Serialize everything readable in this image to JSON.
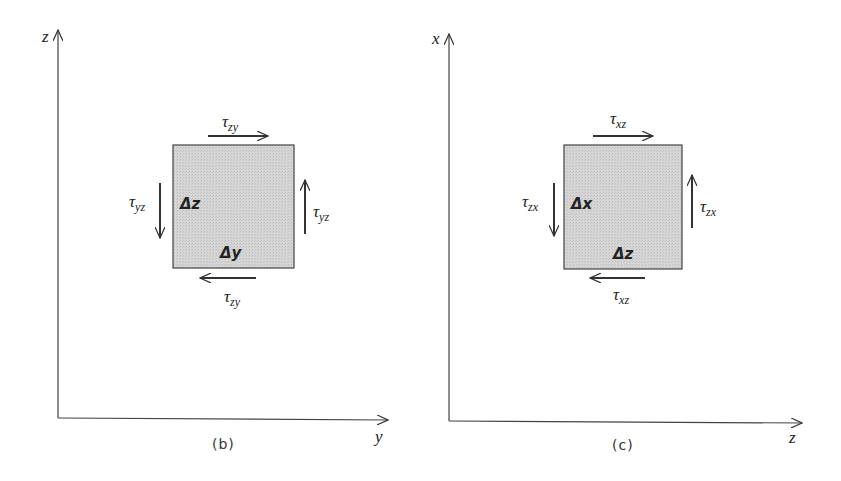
{
  "panels": [
    {
      "id": "b",
      "caption": "(b)",
      "vertical_axis": "z",
      "horizontal_axis": "y",
      "element_label_vertical": "Δz",
      "element_label_horizontal": "Δy",
      "top_stress": {
        "sym": "τ",
        "sub": "zy",
        "direction": "right"
      },
      "bottom_stress": {
        "sym": "τ",
        "sub": "zy",
        "direction": "left"
      },
      "left_stress": {
        "sym": "τ",
        "sub": "yz",
        "direction": "down"
      },
      "right_stress": {
        "sym": "τ",
        "sub": "yz",
        "direction": "up"
      }
    },
    {
      "id": "c",
      "caption": "(c)",
      "vertical_axis": "x",
      "horizontal_axis": "z",
      "element_label_vertical": "Δx",
      "element_label_horizontal": "Δz",
      "top_stress": {
        "sym": "τ",
        "sub": "xz",
        "direction": "right"
      },
      "bottom_stress": {
        "sym": "τ",
        "sub": "xz",
        "direction": "left"
      },
      "left_stress": {
        "sym": "τ",
        "sub": "zx",
        "direction": "down"
      },
      "right_stress": {
        "sym": "τ",
        "sub": "zx",
        "direction": "up"
      }
    }
  ],
  "colors": {
    "line": "#333333",
    "element_fill": "#d4d4d4",
    "background": "#ffffff"
  }
}
